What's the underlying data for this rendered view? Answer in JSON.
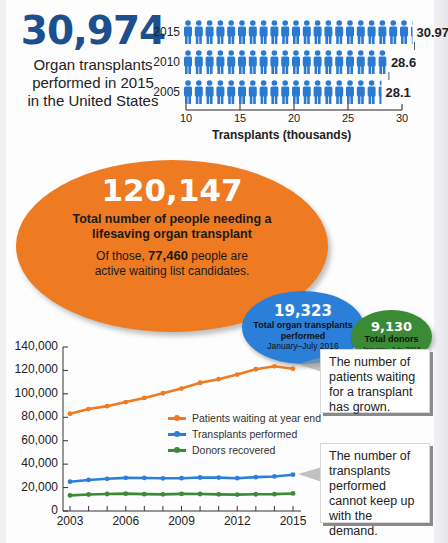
{
  "header_stat": {
    "number": "30,974",
    "caption_line1": "Organ transplants",
    "caption_line2": "performed in 2015",
    "caption_line3": "in the United States"
  },
  "bubbles": {
    "needing": {
      "number": "120,147",
      "line1": "Total number of people needing a",
      "line2": "lifesaving organ transplant",
      "sub_prefix": "Of those,",
      "sub_number": "77,460",
      "sub_suffix": "people are",
      "sub_line2": "active waiting list candidates.",
      "color": "#ee7a22"
    },
    "transplants": {
      "number": "19,323",
      "line1": "Total organ transplants",
      "line2": "performed",
      "period": "January–July 2016",
      "color": "#2c7fd8"
    },
    "donors": {
      "number": "9,130",
      "line1": "Total donors",
      "period": "January–July 2016",
      "color": "#3b8a35"
    }
  },
  "callouts": {
    "waiting": "The number of patients waiting for a transplant has grown.",
    "transplants": "The number of transplants performed cannot keep up with the demand."
  },
  "chart_data": [
    {
      "type": "bar",
      "subtype": "pictogram",
      "title": "",
      "categories": [
        "2015",
        "2010",
        "2005"
      ],
      "values": [
        30.97,
        28.6,
        28.1
      ],
      "value_labels": [
        "30.97",
        "28.6",
        "28.1"
      ],
      "xlabel": "Transplants (thousands)",
      "ylabel": "",
      "xticks": [
        "10",
        "15",
        "20",
        "25",
        "30"
      ],
      "xlim": [
        10,
        30
      ],
      "orientation": "horizontal",
      "color": "#2a7ad2",
      "grid": false
    },
    {
      "type": "line",
      "title": "",
      "x": [
        2003,
        2004,
        2005,
        2006,
        2007,
        2008,
        2009,
        2010,
        2011,
        2012,
        2013,
        2014,
        2015
      ],
      "xticks": [
        "2003",
        "2006",
        "2009",
        "2012",
        "2015"
      ],
      "yticks": [
        "0",
        "20,000",
        "40,000",
        "60,000",
        "80,000",
        "100,000",
        "120,000",
        "140,000"
      ],
      "ylim": [
        0,
        140000
      ],
      "xlabel": "",
      "ylabel": "",
      "grid": false,
      "legend_position": "center-right",
      "series": [
        {
          "name": "Patients waiting at year end",
          "color": "#ee7a22",
          "values": [
            83000,
            87000,
            89500,
            93000,
            96500,
            100500,
            104500,
            109500,
            112500,
            116500,
            121000,
            123500,
            121500
          ]
        },
        {
          "name": "Transplants performed",
          "color": "#2c7fd8",
          "values": [
            25000,
            26500,
            27500,
            28300,
            28200,
            27900,
            28000,
            28600,
            28500,
            28000,
            28900,
            29500,
            30970
          ]
        },
        {
          "name": "Donors recovered",
          "color": "#3b8a35",
          "values": [
            13300,
            14100,
            14500,
            14800,
            14400,
            14200,
            14600,
            14500,
            14200,
            14000,
            14300,
            14400,
            15000
          ]
        }
      ]
    }
  ]
}
